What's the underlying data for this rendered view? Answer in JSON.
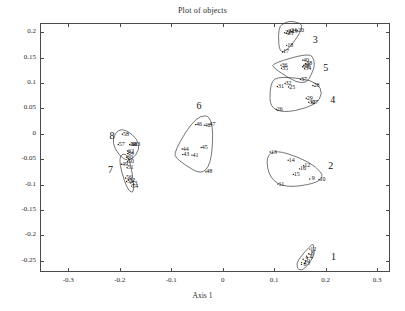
{
  "chart_data": {
    "type": "scatter",
    "title": "Plot of objects",
    "xlabel": "Axis 1",
    "ylabel": "Axis 2",
    "xlim": [
      -0.355,
      0.325
    ],
    "ylim": [
      -0.272,
      0.218
    ],
    "xticks": [
      -0.3,
      -0.2,
      -0.1,
      0,
      0.1,
      0.2,
      0.3
    ],
    "xticklabels": [
      "-0.3",
      "-0.2",
      "-0.1",
      "0",
      "0.1",
      "0.2",
      "0.3"
    ],
    "yticks": [
      0.2,
      0.15,
      0.1,
      0.05,
      0,
      -0.05,
      -0.1,
      -0.15,
      -0.2,
      -0.25
    ],
    "yticklabels": [
      "0.2",
      "0.15",
      "0.1",
      "0.05",
      "0",
      "-0.05",
      "-0.1",
      "-0.15",
      "-0.2",
      "-0.25"
    ],
    "grid": false,
    "legend": "none",
    "marker": "dot-with-numeric-label",
    "points": [
      {
        "label": "1",
        "x": 0.168,
        "y": -0.25
      },
      {
        "label": "2",
        "x": 0.16,
        "y": -0.252
      },
      {
        "label": "3",
        "x": 0.163,
        "y": -0.246
      },
      {
        "label": "4",
        "x": 0.172,
        "y": -0.243
      },
      {
        "label": "5",
        "x": 0.166,
        "y": -0.254
      },
      {
        "label": "6",
        "x": 0.16,
        "y": -0.256
      },
      {
        "label": "7",
        "x": 0.17,
        "y": -0.24
      },
      {
        "label": "8",
        "x": 0.174,
        "y": -0.235
      },
      {
        "label": "12",
        "x": 0.176,
        "y": -0.226
      },
      {
        "label": "9",
        "x": 0.176,
        "y": -0.088
      },
      {
        "label": "10",
        "x": 0.194,
        "y": -0.089
      },
      {
        "label": "11",
        "x": 0.114,
        "y": -0.098
      },
      {
        "label": "13",
        "x": 0.099,
        "y": -0.035
      },
      {
        "label": "14",
        "x": 0.134,
        "y": -0.051
      },
      {
        "label": "15",
        "x": 0.144,
        "y": -0.079
      },
      {
        "label": "16",
        "x": 0.156,
        "y": -0.068
      },
      {
        "label": "12b",
        "x": 0.164,
        "y": -0.062,
        "display": "12"
      },
      {
        "label": "17",
        "x": 0.123,
        "y": 0.162
      },
      {
        "label": "18",
        "x": 0.131,
        "y": 0.175
      },
      {
        "label": "19",
        "x": 0.14,
        "y": 0.202
      },
      {
        "label": "20",
        "x": 0.152,
        "y": 0.204
      },
      {
        "label": "21",
        "x": 0.133,
        "y": 0.203
      },
      {
        "label": "22",
        "x": 0.127,
        "y": 0.2
      },
      {
        "label": "23",
        "x": 0.131,
        "y": 0.199
      },
      {
        "label": "24",
        "x": 0.138,
        "y": 0.205
      },
      {
        "label": "25",
        "x": 0.135,
        "y": 0.093
      },
      {
        "label": "26",
        "x": 0.111,
        "y": 0.049
      },
      {
        "label": "27",
        "x": 0.18,
        "y": 0.063
      },
      {
        "label": "28",
        "x": 0.182,
        "y": 0.096
      },
      {
        "label": "29",
        "x": 0.169,
        "y": 0.071
      },
      {
        "label": "30",
        "x": 0.174,
        "y": 0.063
      },
      {
        "label": "31",
        "x": 0.113,
        "y": 0.094
      },
      {
        "label": "32",
        "x": 0.128,
        "y": 0.1
      },
      {
        "label": "33",
        "x": 0.162,
        "y": 0.133
      },
      {
        "label": "34",
        "x": 0.166,
        "y": 0.129
      },
      {
        "label": "35",
        "x": 0.121,
        "y": 0.13
      },
      {
        "label": "36",
        "x": 0.12,
        "y": 0.136
      },
      {
        "label": "37",
        "x": 0.158,
        "y": 0.108
      },
      {
        "label": "38",
        "x": 0.168,
        "y": 0.139
      },
      {
        "label": "39",
        "x": 0.164,
        "y": 0.135
      },
      {
        "label": "40",
        "x": 0.162,
        "y": 0.146
      },
      {
        "label": "41",
        "x": -0.053,
        "y": -0.041
      },
      {
        "label": "42",
        "x": -0.029,
        "y": 0.018
      },
      {
        "label": "43",
        "x": -0.071,
        "y": -0.04
      },
      {
        "label": "44",
        "x": -0.072,
        "y": -0.029
      },
      {
        "label": "45",
        "x": -0.035,
        "y": -0.026
      },
      {
        "label": "46",
        "x": -0.046,
        "y": 0.019
      },
      {
        "label": "47",
        "x": -0.02,
        "y": 0.019
      },
      {
        "label": "48",
        "x": -0.026,
        "y": -0.074
      },
      {
        "label": "49",
        "x": -0.19,
        "y": -0.059
      },
      {
        "label": "50",
        "x": -0.178,
        "y": -0.054
      },
      {
        "label": "51",
        "x": -0.179,
        "y": -0.066
      },
      {
        "label": "52",
        "x": -0.176,
        "y": -0.09
      },
      {
        "label": "53",
        "x": -0.172,
        "y": -0.096
      },
      {
        "label": "54",
        "x": -0.17,
        "y": -0.102
      },
      {
        "label": "55",
        "x": -0.18,
        "y": -0.093
      },
      {
        "label": "56",
        "x": -0.182,
        "y": -0.086
      },
      {
        "label": "57",
        "x": -0.196,
        "y": -0.02
      },
      {
        "label": "58",
        "x": -0.188,
        "y": 0.0
      },
      {
        "label": "59",
        "x": -0.174,
        "y": -0.02
      },
      {
        "label": "60",
        "x": -0.18,
        "y": -0.045
      },
      {
        "label": "61",
        "x": -0.171,
        "y": -0.021
      },
      {
        "label": "62",
        "x": -0.178,
        "y": -0.033
      },
      {
        "label": "63",
        "x": -0.166,
        "y": -0.021
      },
      {
        "label": "64",
        "x": -0.178,
        "y": -0.038
      }
    ],
    "cluster_labels": [
      {
        "name": "1",
        "x": 0.215,
        "y": -0.241
      },
      {
        "name": "2",
        "x": 0.21,
        "y": -0.061
      },
      {
        "name": "3",
        "x": 0.18,
        "y": 0.186
      },
      {
        "name": "4",
        "x": 0.214,
        "y": 0.068
      },
      {
        "name": "5",
        "x": 0.2,
        "y": 0.131
      },
      {
        "name": "6",
        "x": -0.046,
        "y": 0.057
      },
      {
        "name": "7",
        "x": -0.218,
        "y": -0.07
      },
      {
        "name": "8",
        "x": -0.215,
        "y": -0.002
      }
    ]
  }
}
